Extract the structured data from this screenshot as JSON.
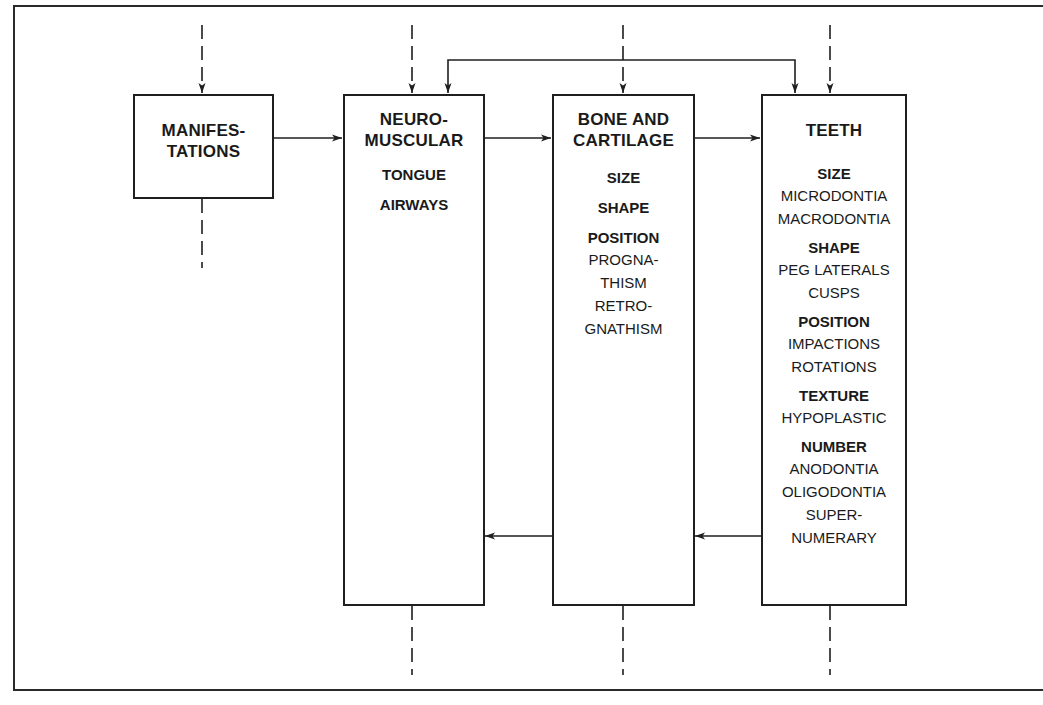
{
  "diagram": {
    "boxes": {
      "manifestations": {
        "title": "MANIFES-\nTATIONS"
      },
      "neuromuscular": {
        "title": "NEURO-\nMUSCULAR",
        "items": [
          {
            "heading": "TONGUE"
          },
          {
            "heading": "AIRWAYS"
          }
        ]
      },
      "bone_cartilage": {
        "title": "BONE AND\nCARTILAGE",
        "items": [
          {
            "heading": "SIZE"
          },
          {
            "heading": "SHAPE"
          },
          {
            "heading": "POSITION",
            "details": "PROGNA-\nTHISM\nRETRO-\nGNATHISM"
          }
        ]
      },
      "teeth": {
        "title": "TEETH",
        "items": [
          {
            "heading": "SIZE",
            "details": "MICRODONTIA\nMACRODONTIA"
          },
          {
            "heading": "SHAPE",
            "details": "PEG LATERALS\nCUSPS"
          },
          {
            "heading": "POSITION",
            "details": "IMPACTIONS\nROTATIONS"
          },
          {
            "heading": "TEXTURE",
            "details": "HYPOPLASTIC"
          },
          {
            "heading": "NUMBER",
            "details": "ANODONTIA\nOLIGODONTIA\nSUPER-\nNUMERARY"
          }
        ]
      }
    },
    "connections": [
      {
        "from": "manifestations",
        "to": "neuromuscular",
        "style": "solid"
      },
      {
        "from": "neuromuscular",
        "to": "bone_cartilage",
        "style": "solid"
      },
      {
        "from": "bone_cartilage",
        "to": "teeth",
        "style": "solid"
      },
      {
        "from": "bone_cartilage",
        "to": "neuromuscular",
        "style": "solid"
      },
      {
        "from": "teeth",
        "to": "bone_cartilage",
        "style": "solid"
      },
      {
        "from": "neuromuscular",
        "to": "teeth",
        "style": "solid",
        "route": "over-top",
        "bidirectional": true
      }
    ],
    "colors": {
      "ink": "#1f1f1f",
      "background": "#ffffff"
    }
  }
}
